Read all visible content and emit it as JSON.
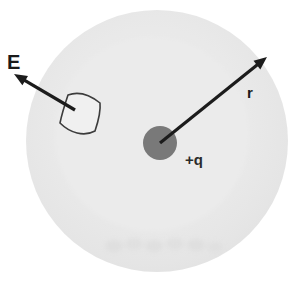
{
  "diagram": {
    "type": "physics-diagram",
    "labels": {
      "field": "E",
      "radius": "r",
      "charge": "+q"
    },
    "colors": {
      "background": "#ffffff",
      "sphere_fill_outer": "#e3e3e3",
      "sphere_fill_inner": "#ebebeb",
      "charge_fill": "#797979",
      "arrow_color": "#1c1c1c",
      "patch_fill": "#f0f0f0",
      "patch_stroke": "#3c3c3c",
      "label_color": "#1a1a1a"
    }
  }
}
